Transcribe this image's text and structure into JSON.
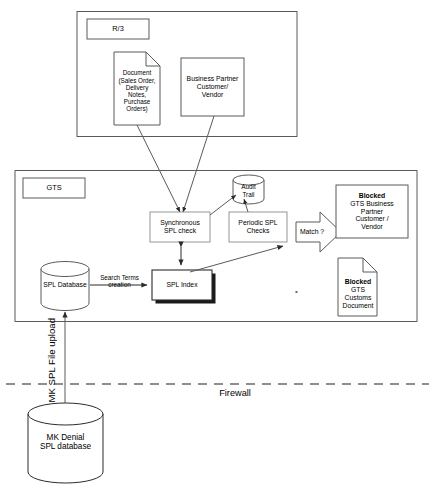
{
  "diagram": {
    "containers": [
      {
        "id": "r3",
        "label": "R/3"
      },
      {
        "id": "gts",
        "label": "GTS"
      }
    ],
    "nodes": {
      "document": {
        "name": "Document",
        "lines": [
          "Document",
          "(Sales Order,",
          "Delivery",
          "Notes,",
          "Purchase",
          "Orders)"
        ]
      },
      "business_partner": {
        "lines": [
          "Business Partner",
          "Customer/",
          "Vendor"
        ]
      },
      "audit_trail": {
        "lines": [
          "Audit",
          "Trail"
        ]
      },
      "synchronous_check": {
        "lines": [
          "Synchronous",
          "SPL check"
        ]
      },
      "periodic_checks": {
        "lines": [
          "Periodic SPL",
          "Checks"
        ]
      },
      "spl_index": {
        "lines": [
          "SPL Index"
        ]
      },
      "spl_database": {
        "lines": [
          "SPL Database"
        ]
      },
      "mk_denial_database": {
        "lines": [
          "MK Denial",
          "SPL database"
        ]
      },
      "blocked_partner": {
        "heading": "Blocked",
        "lines": [
          "GTS Business",
          "Partner",
          "Customer /",
          "Vendor"
        ]
      },
      "blocked_customs_document": {
        "heading": "Blocked",
        "lines": [
          "GTS",
          "Customs",
          "Document"
        ]
      }
    },
    "edge_labels": {
      "search_terms": [
        "Search Terms",
        "creation"
      ],
      "match": "Match ?",
      "upload": "MK SPL File upload",
      "firewall": "Firewall"
    },
    "colors": {
      "stroke": "#5a5a5a",
      "stroke_dark": "#2b2b2b",
      "text": "#000000",
      "background": "#ffffff",
      "shadow": "#1a1a1a"
    }
  }
}
